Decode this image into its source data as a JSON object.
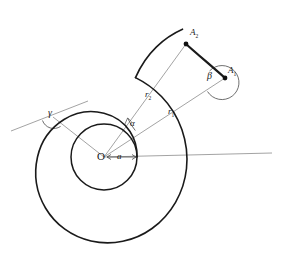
{
  "figure": {
    "kind": "geometry-diagram",
    "background_color": "#ffffff",
    "curve_color": "#1a1a1a",
    "construction_line_color": "#8c8c8c",
    "label_color": "#1a1a1a",
    "width": 287,
    "height": 267
  },
  "labels": {
    "origin": "O",
    "pitch": "a",
    "radius_1_letter": "r",
    "radius_1_sub": "1",
    "radius_2_letter": "r",
    "radius_2_sub": "2",
    "point_1_letter": "A",
    "point_1_sub": "1",
    "point_2_letter": "A",
    "point_2_sub": "2",
    "angle_center": "α",
    "angle_at_point_1": "β",
    "angle_tangent": "γ"
  },
  "geometry": {
    "center": {
      "x": 104,
      "y": 157
    },
    "inner_circle_radius": 33,
    "polar_axis_end": {
      "x": 272,
      "y": 153
    },
    "pitch_dimension": {
      "from_x": 104,
      "to_x": 137,
      "y": 157
    },
    "point_A1": {
      "x": 225,
      "y": 78
    },
    "point_A2": {
      "x": 186,
      "y": 44
    },
    "tangent_vertex": {
      "x": 53,
      "y": 117
    },
    "tangent_start": {
      "x": 11,
      "y": 131
    },
    "tangent_end": {
      "x": 88,
      "y": 101
    },
    "spiral_start_angle_deg": 0,
    "spiral_turns": 1.0,
    "spiral_r_start": 33,
    "spiral_r_end": 98
  }
}
